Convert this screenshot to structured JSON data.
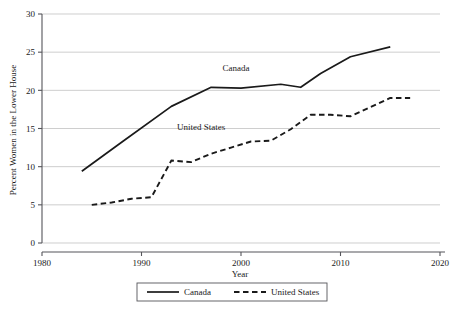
{
  "chart_data": {
    "type": "line",
    "title": "",
    "subtitle": "",
    "xlabel": "Year",
    "ylabel": "Percent Women in the Lower House",
    "xlim": [
      1980,
      2020
    ],
    "ylim": [
      0,
      30
    ],
    "xticks": [
      1980,
      1990,
      2000,
      2010,
      2020
    ],
    "xtick_labels": [
      "1980",
      "1990",
      "2000",
      "2010",
      "2020"
    ],
    "yticks": [
      0,
      5,
      10,
      15,
      20,
      25,
      30
    ],
    "ytick_labels": [
      "0",
      "5",
      "10",
      "15",
      "20",
      "25",
      "30"
    ],
    "grid": "horizontal",
    "legend_position": "below",
    "series": [
      {
        "name": "Canada",
        "style": "solid",
        "color": "#1a1a1a",
        "x": [
          1984,
          1988,
          1993,
          1997,
          2000,
          2004,
          2006,
          2008,
          2011,
          2015
        ],
        "values": [
          9.4,
          13.2,
          17.9,
          20.4,
          20.3,
          20.8,
          20.4,
          22.2,
          24.4,
          25.7
        ]
      },
      {
        "name": "United States",
        "style": "dashed",
        "color": "#1a1a1a",
        "x": [
          1985,
          1987,
          1989,
          1991,
          1993,
          1995,
          1997,
          1999,
          2001,
          2003,
          2005,
          2007,
          2009,
          2011,
          2013,
          2015,
          2017
        ],
        "values": [
          5.0,
          5.3,
          5.8,
          6.0,
          10.8,
          10.6,
          11.7,
          12.5,
          13.3,
          13.4,
          14.9,
          16.8,
          16.8,
          16.6,
          17.8,
          19.0,
          19.0
        ]
      }
    ],
    "annotations": [
      {
        "text": "Canada",
        "x": 1999.5,
        "y": 22.5
      },
      {
        "text": "United States",
        "x": 1996.0,
        "y": 14.8
      }
    ]
  },
  "legend": {
    "items": [
      {
        "label": "Canada",
        "style": "solid"
      },
      {
        "label": "United States",
        "style": "dashed"
      }
    ]
  }
}
